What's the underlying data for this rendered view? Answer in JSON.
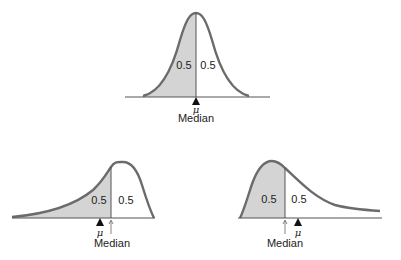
{
  "colors": {
    "curve": "#6b6b6b",
    "shade": "#d4d4d4",
    "axis": "#555555",
    "text": "#222222"
  },
  "diagrams": [
    {
      "id": "symmetric",
      "left_area": "0.5",
      "right_area": "0.5",
      "mean_symbol": "μ",
      "median_label": "Median",
      "note": "mean equals median"
    },
    {
      "id": "left-skewed",
      "left_area": "0.5",
      "right_area": "0.5",
      "mean_symbol": "μ",
      "median_label": "Median",
      "note": "mean left of median"
    },
    {
      "id": "right-skewed",
      "left_area": "0.5",
      "right_area": "0.5",
      "mean_symbol": "μ",
      "median_label": "Median",
      "note": "mean right of median"
    }
  ]
}
